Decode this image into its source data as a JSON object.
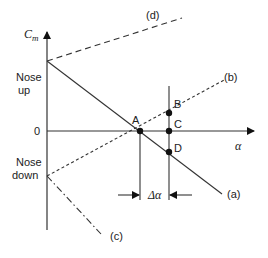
{
  "diagram": {
    "y_axis": {
      "label_main": "C",
      "label_sub": "m"
    },
    "x_axis": {
      "label": "α"
    },
    "zero_label": "0",
    "nose_up": [
      "Nose",
      "up"
    ],
    "nose_down": [
      "Nose",
      "down"
    ],
    "delta_label": "Δα",
    "points": {
      "A": "A",
      "B": "B",
      "C": "C",
      "D": "D"
    },
    "curves": {
      "a": "(a)",
      "b": "(b)",
      "c": "(c)",
      "d": "(d)"
    },
    "colors": {
      "line": "#2a2a2a",
      "background": "#ffffff"
    }
  }
}
